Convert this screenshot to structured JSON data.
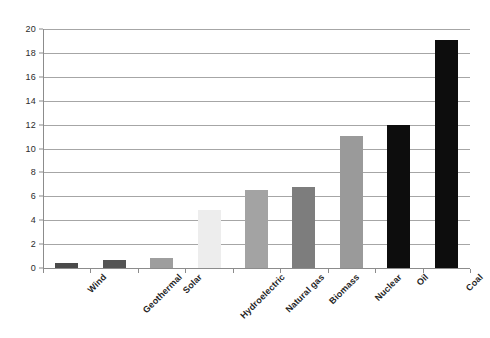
{
  "chart_data": {
    "type": "bar",
    "title": "",
    "subtitle": "",
    "xlabel": "",
    "ylabel": "",
    "ylim": [
      0,
      20
    ],
    "y_ticks": [
      0,
      2,
      4,
      6,
      8,
      10,
      12,
      14,
      16,
      18,
      20
    ],
    "grid": true,
    "grid_axis": "y",
    "legend": false,
    "legend_position": "none",
    "background_color": "#ffffff",
    "gridline_color": "#a6a6a6",
    "axis_color": "#8c8c8c",
    "categories": [
      "Wind",
      "Geothermal",
      "Solar",
      "Hydroelectric",
      "Natural gas",
      "Biomass",
      "Nuclear",
      "Oil",
      "Coal"
    ],
    "values": [
      0.4,
      0.7,
      0.85,
      4.85,
      6.5,
      6.75,
      11.05,
      12.0,
      19.1
    ],
    "bar_colors": [
      "#4a4a4a",
      "#545454",
      "#9e9e9e",
      "#ededed",
      "#a3a3a3",
      "#7d7d7d",
      "#9a9a9a",
      "#0d0d0d",
      "#0d0d0d"
    ],
    "bars": [
      {
        "label": "Wind",
        "value": 0.4,
        "color": "#4a4a4a"
      },
      {
        "label": "Geothermal",
        "value": 0.7,
        "color": "#545454"
      },
      {
        "label": "Solar",
        "value": 0.85,
        "color": "#9e9e9e"
      },
      {
        "label": "Hydroelectric",
        "value": 4.85,
        "color": "#ededed"
      },
      {
        "label": "Natural gas",
        "value": 6.5,
        "color": "#a3a3a3"
      },
      {
        "label": "Biomass",
        "value": 6.75,
        "color": "#7d7d7d"
      },
      {
        "label": "Nuclear",
        "value": 11.05,
        "color": "#9a9a9a"
      },
      {
        "label": "Oil",
        "value": 12.0,
        "color": "#0d0d0d"
      },
      {
        "label": "Coal",
        "value": 19.1,
        "color": "#0d0d0d"
      }
    ]
  }
}
